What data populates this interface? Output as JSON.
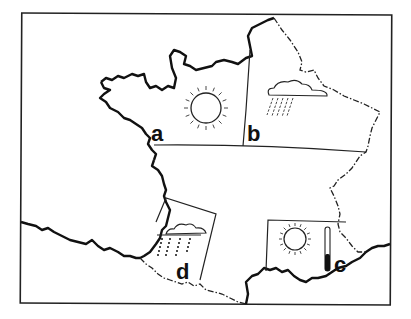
{
  "map": {
    "subject": "Weather map of France",
    "colors": {
      "ink": "#111111",
      "background": "#ffffff"
    },
    "regions": [
      {
        "id": "a",
        "label": "a",
        "weather": "sunny",
        "icon": "sun-icon",
        "area": "north-west"
      },
      {
        "id": "b",
        "label": "b",
        "weather": "rain",
        "icon": "rain-cloud-icon",
        "area": "north-east"
      },
      {
        "id": "c",
        "label": "c",
        "weather": "sunny and hot",
        "icon": "sun-icon",
        "extra_icon": "thermometer-icon",
        "area": "south-east"
      },
      {
        "id": "d",
        "label": "d",
        "weather": "heavy rain",
        "icon": "heavy-rain-cloud-icon",
        "area": "south-west"
      }
    ]
  }
}
